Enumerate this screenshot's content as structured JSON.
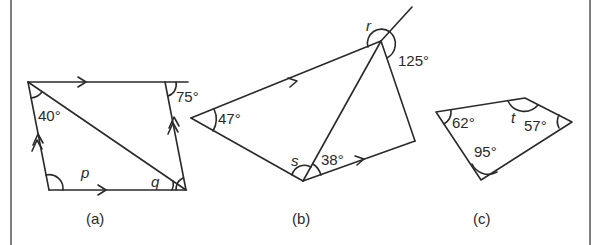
{
  "figure": {
    "colors": {
      "stroke": "#2a2a2a",
      "background": "#ffffff",
      "frame": "#555555"
    },
    "diagrams": [
      {
        "id": "a",
        "caption": "(a)",
        "shape": "parallelogram with diagonal",
        "angles": [
          {
            "label": "40°",
            "type": "given"
          },
          {
            "label": "75°",
            "type": "given"
          },
          {
            "label": "p",
            "type": "unknown"
          },
          {
            "label": "q",
            "type": "unknown"
          }
        ],
        "markers": [
          "single arrow (top edge)",
          "single arrow (bottom edge)",
          "double arrow (left edge)",
          "double arrow (right edge)"
        ]
      },
      {
        "id": "b",
        "caption": "(b)",
        "shape": "quadrilateral with diagonal and extended side",
        "angles": [
          {
            "label": "47°",
            "type": "given"
          },
          {
            "label": "125°",
            "type": "given"
          },
          {
            "label": "38°",
            "type": "given"
          },
          {
            "label": "r",
            "type": "unknown"
          },
          {
            "label": "s",
            "type": "unknown"
          }
        ],
        "markers": [
          "single arrow (upper-left edge)",
          "single arrow (lower-right edge)"
        ]
      },
      {
        "id": "c",
        "caption": "(c)",
        "shape": "quadrilateral",
        "angles": [
          {
            "label": "62°",
            "type": "given"
          },
          {
            "label": "57°",
            "type": "given"
          },
          {
            "label": "95°",
            "type": "given"
          },
          {
            "label": "t",
            "type": "unknown"
          }
        ]
      }
    ]
  },
  "a": {
    "caption": "(a)",
    "angle1": "40°",
    "angle2": "75°",
    "p": "p",
    "q": "q"
  },
  "b": {
    "caption": "(b)",
    "angle1": "47°",
    "angle2": "125°",
    "angle3": "38°",
    "r": "r",
    "s": "s"
  },
  "c": {
    "caption": "(c)",
    "angle1": "62°",
    "angle2": "57°",
    "angle3": "95°",
    "t": "t"
  }
}
